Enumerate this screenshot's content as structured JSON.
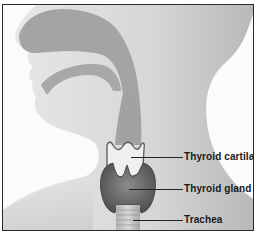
{
  "diagram": {
    "labels": [
      {
        "id": "thyroid-cartilage",
        "text": "Thyroid cartilage"
      },
      {
        "id": "thyroid-gland",
        "text": "Thyroid gland"
      },
      {
        "id": "trachea",
        "text": "Trachea"
      }
    ],
    "colors": {
      "background": "#fbfbfb",
      "skin": "#d9d9d9",
      "airway": "#9e9e9e",
      "gland": "#6f6f6f",
      "border": "#2a2a2a",
      "text": "#1a1a1a"
    }
  }
}
